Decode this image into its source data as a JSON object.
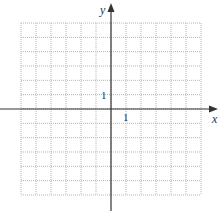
{
  "diagram": {
    "type": "coordinate-grid",
    "x_axis_label": "x",
    "y_axis_label": "y",
    "x_tick_label": "1",
    "y_tick_label": "1",
    "grid": {
      "x_min": -6,
      "x_max": 6,
      "y_min": -6,
      "y_max": 6,
      "step": 1,
      "line_style": "dotted"
    },
    "colors": {
      "axis": "#333333",
      "grid": "#b5b5b5",
      "background": "#ffffff"
    }
  }
}
